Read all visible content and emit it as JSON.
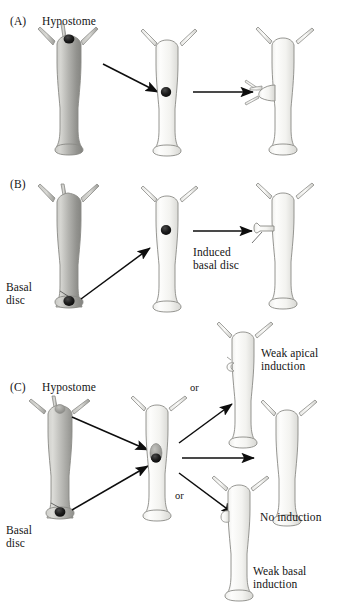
{
  "figure": {
    "background_color": "#ffffff",
    "panels": [
      {
        "id": "A",
        "id_label": "(A)",
        "annotations": [
          {
            "name": "hypostome-label",
            "text": "Hypostome"
          }
        ],
        "organisms": [
          {
            "name": "donor-hydra",
            "shade": "dark",
            "marker": "black-hypostome"
          },
          {
            "name": "host-hydra-grafted",
            "shade": "light",
            "marker": "black-graft-dot"
          },
          {
            "name": "host-hydra-secondary-axis",
            "shade": "light",
            "marker": "induced-head-with-tentacles"
          }
        ],
        "arrows": [
          "diagonal-transplant-arrow",
          "horizontal-result-arrow"
        ]
      },
      {
        "id": "B",
        "id_label": "(B)",
        "annotations": [
          {
            "name": "basal-disc-label",
            "text": "Basal\ndisc"
          },
          {
            "name": "induced-basal-disc-label",
            "text": "Induced\nbasal disc"
          }
        ],
        "organisms": [
          {
            "name": "donor-hydra",
            "shade": "dark",
            "marker": "black-basal-disc"
          },
          {
            "name": "host-hydra-grafted",
            "shade": "light",
            "marker": "black-graft-dot"
          },
          {
            "name": "host-hydra-induced-foot",
            "shade": "light",
            "marker": "induced-basal-disc-stalk"
          }
        ],
        "arrows": [
          "diagonal-transplant-arrow",
          "horizontal-result-arrow"
        ]
      },
      {
        "id": "C",
        "id_label": "(C)",
        "annotations": [
          {
            "name": "hypostome-label",
            "text": "Hypostome"
          },
          {
            "name": "basal-disc-label",
            "text": "Basal\ndisc"
          },
          {
            "name": "weak-apical-induction-label",
            "text": "Weak apical\ninduction"
          },
          {
            "name": "no-induction-label",
            "text": "No induction"
          },
          {
            "name": "weak-basal-induction-label",
            "text": "Weak basal\ninduction"
          },
          {
            "name": "or-label-upper",
            "text": "or"
          },
          {
            "name": "or-label-lower",
            "text": "or"
          }
        ],
        "organisms": [
          {
            "name": "donor-hydra",
            "shade": "dark",
            "marker": "gray-hypostome-and-black-basal-disc"
          },
          {
            "name": "host-hydra-double-graft",
            "shade": "light",
            "marker": "two-tone-graft"
          },
          {
            "name": "outcome-weak-apical",
            "shade": "light",
            "marker": "small-apical-bump"
          },
          {
            "name": "outcome-no-induction",
            "shade": "light",
            "marker": "none"
          },
          {
            "name": "outcome-weak-basal",
            "shade": "light",
            "marker": "small-basal-bump"
          }
        ],
        "arrows": [
          "diagonal-transplant-arrow-apex",
          "diagonal-transplant-arrow-base",
          "branch-arrow-up",
          "branch-arrow-straight",
          "branch-arrow-down"
        ]
      }
    ],
    "colors": {
      "donor_body_light": "#d9d9d6",
      "donor_body_dark": "#8e8e8b",
      "host_body_light": "#fbfbfa",
      "host_body_dark": "#d2d2cf",
      "outline": "#8a8a86",
      "marker_black": "#171717",
      "marker_gray": "#9b9b98",
      "arrow": "#0d0d0d",
      "leader_line": "#3a3a3a",
      "text": "#141414"
    }
  }
}
